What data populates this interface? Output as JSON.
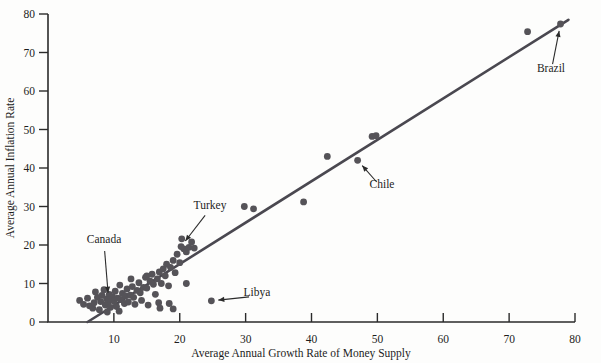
{
  "chart_data": {
    "type": "scatter",
    "title": "",
    "xlabel": "Average Annual Growth Rate of Money Supply",
    "ylabel": "Average Annual Inflation Rate",
    "xlim": [
      0,
      80
    ],
    "ylim": [
      0,
      80
    ],
    "xticks": [
      10,
      20,
      30,
      40,
      50,
      60,
      70,
      80
    ],
    "yticks": [
      0,
      10,
      20,
      30,
      40,
      50,
      60,
      70,
      80
    ],
    "xtick_labels": [
      "10",
      "20",
      "30",
      "40",
      "50",
      "60",
      "70",
      "80"
    ],
    "ytick_labels": [
      "0",
      "10",
      "20",
      "30",
      "40",
      "50",
      "60",
      "70",
      "80"
    ],
    "grid": false,
    "legend": "none",
    "point_color": "#555358",
    "line_color": "#4a4850",
    "axis_color": "#2b2b2b",
    "fit_line": {
      "name": "regression-line",
      "x": [
        6.0,
        79.0
      ],
      "y": [
        0.0,
        78.5
      ]
    },
    "points": [
      {
        "x": 4.8,
        "y": 5.6
      },
      {
        "x": 5.4,
        "y": 4.6
      },
      {
        "x": 6.0,
        "y": 6.2
      },
      {
        "x": 6.3,
        "y": 4.2
      },
      {
        "x": 6.8,
        "y": 3.6
      },
      {
        "x": 7.0,
        "y": 5.0
      },
      {
        "x": 7.2,
        "y": 7.8
      },
      {
        "x": 7.5,
        "y": 6.4
      },
      {
        "x": 7.8,
        "y": 3.2
      },
      {
        "x": 8.0,
        "y": 5.3
      },
      {
        "x": 8.2,
        "y": 6.9
      },
      {
        "x": 8.5,
        "y": 8.4
      },
      {
        "x": 8.7,
        "y": 4.4
      },
      {
        "x": 8.9,
        "y": 6.0
      },
      {
        "x": 9.1,
        "y": 5.1
      },
      {
        "x": 9.3,
        "y": 7.2
      },
      {
        "x": 9.5,
        "y": 3.8
      },
      {
        "x": 9.8,
        "y": 6.6
      },
      {
        "x": 10.0,
        "y": 5.4
      },
      {
        "x": 10.2,
        "y": 8.0
      },
      {
        "x": 10.4,
        "y": 4.0
      },
      {
        "x": 10.6,
        "y": 6.2
      },
      {
        "x": 10.9,
        "y": 9.6
      },
      {
        "x": 11.1,
        "y": 5.8
      },
      {
        "x": 11.3,
        "y": 7.4
      },
      {
        "x": 11.6,
        "y": 4.8
      },
      {
        "x": 11.8,
        "y": 6.8
      },
      {
        "x": 12.0,
        "y": 8.6
      },
      {
        "x": 12.2,
        "y": 5.2
      },
      {
        "x": 12.5,
        "y": 7.0
      },
      {
        "x": 12.8,
        "y": 9.2
      },
      {
        "x": 13.0,
        "y": 6.4
      },
      {
        "x": 13.2,
        "y": 4.6
      },
      {
        "x": 13.5,
        "y": 8.2
      },
      {
        "x": 13.8,
        "y": 10.2
      },
      {
        "x": 14.0,
        "y": 7.6
      },
      {
        "x": 14.2,
        "y": 5.6
      },
      {
        "x": 14.5,
        "y": 9.0
      },
      {
        "x": 14.8,
        "y": 11.6
      },
      {
        "x": 15.0,
        "y": 8.8
      },
      {
        "x": 15.2,
        "y": 4.4
      },
      {
        "x": 15.5,
        "y": 10.6
      },
      {
        "x": 15.8,
        "y": 12.4
      },
      {
        "x": 16.0,
        "y": 9.8
      },
      {
        "x": 16.3,
        "y": 7.2
      },
      {
        "x": 16.6,
        "y": 11.2
      },
      {
        "x": 16.9,
        "y": 13.0
      },
      {
        "x": 17.2,
        "y": 10.0
      },
      {
        "x": 17.5,
        "y": 13.8
      },
      {
        "x": 17.8,
        "y": 12.0
      },
      {
        "x": 18.0,
        "y": 15.0
      },
      {
        "x": 18.3,
        "y": 9.4
      },
      {
        "x": 18.6,
        "y": 14.2
      },
      {
        "x": 19.0,
        "y": 16.0
      },
      {
        "x": 19.3,
        "y": 12.8
      },
      {
        "x": 19.6,
        "y": 17.6
      },
      {
        "x": 20.0,
        "y": 15.4
      },
      {
        "x": 20.3,
        "y": 21.6
      },
      {
        "x": 20.6,
        "y": 19.0
      },
      {
        "x": 21.0,
        "y": 18.2
      },
      {
        "x": 21.4,
        "y": 19.4
      },
      {
        "x": 21.8,
        "y": 20.8
      },
      {
        "x": 22.2,
        "y": 19.2
      },
      {
        "x": 16.8,
        "y": 5.0
      },
      {
        "x": 17.0,
        "y": 3.6
      },
      {
        "x": 18.4,
        "y": 4.8
      },
      {
        "x": 19.0,
        "y": 3.4
      },
      {
        "x": 21.0,
        "y": 10.0
      },
      {
        "x": 15.0,
        "y": 12.0
      },
      {
        "x": 12.6,
        "y": 11.2
      },
      {
        "x": 10.8,
        "y": 2.8
      },
      {
        "x": 9.0,
        "y": 2.6
      },
      {
        "x": 24.8,
        "y": 5.5,
        "label": "Libya"
      },
      {
        "x": 29.8,
        "y": 30.0
      },
      {
        "x": 31.2,
        "y": 29.4
      },
      {
        "x": 38.8,
        "y": 31.2
      },
      {
        "x": 42.4,
        "y": 43.0
      },
      {
        "x": 47.0,
        "y": 42.0,
        "label": "Chile"
      },
      {
        "x": 49.2,
        "y": 48.2
      },
      {
        "x": 49.8,
        "y": 48.4
      },
      {
        "x": 72.8,
        "y": 75.4
      },
      {
        "x": 77.8,
        "y": 77.4,
        "label": "Brazil"
      },
      {
        "x": 9.2,
        "y": 5.8,
        "label": "Canada"
      },
      {
        "x": 20.2,
        "y": 19.6,
        "label": "Turkey"
      }
    ],
    "annotations": [
      {
        "text": "Canada",
        "text_x": 104,
        "text_y": 243,
        "point_x": 9.2,
        "point_y": 5.8
      },
      {
        "text": "Turkey",
        "text_x": 210,
        "text_y": 209,
        "point_x": 20.2,
        "point_y": 19.6
      },
      {
        "text": "Libya",
        "text_x": 257,
        "text_y": 296,
        "point_x": 24.8,
        "point_y": 5.5
      },
      {
        "text": "Chile",
        "text_x": 382,
        "text_y": 188,
        "point_x": 47.0,
        "point_y": 42.0
      },
      {
        "text": "Brazil",
        "text_x": 551,
        "text_y": 72,
        "point_x": 77.8,
        "point_y": 77.4
      }
    ]
  }
}
